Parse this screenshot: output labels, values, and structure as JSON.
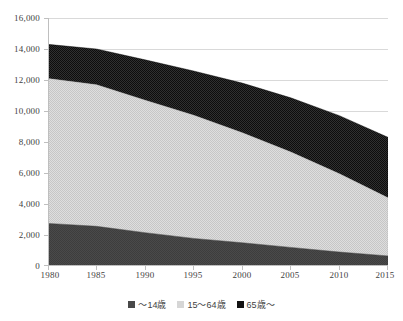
{
  "chart_data": {
    "type": "area",
    "stacked": true,
    "title": "",
    "subtitle": "",
    "xlabel": "",
    "ylabel": "",
    "x": [
      1980,
      1985,
      1990,
      1995,
      2000,
      2005,
      2010,
      2015
    ],
    "categories": [
      "1980",
      "1985",
      "1990",
      "1995",
      "2000",
      "2005",
      "2010",
      "2015"
    ],
    "series": [
      {
        "name": "〜14歳",
        "color": "#494949",
        "pattern": "solid-dark-gray",
        "values": [
          2750,
          2560,
          2150,
          1780,
          1500,
          1200,
          900,
          650
        ]
      },
      {
        "name": "15〜64歳",
        "color": "#d6d6d6",
        "pattern": "light-gray-checker",
        "values": [
          9350,
          9140,
          8550,
          7950,
          7100,
          6150,
          5050,
          3750
        ]
      },
      {
        "name": "65歳〜",
        "color": "#121212",
        "pattern": "black-dotted",
        "values": [
          2200,
          2300,
          2600,
          2850,
          3200,
          3500,
          3750,
          3900
        ]
      }
    ],
    "cumulative_totals": [
      14300,
      14000,
      13300,
      12580,
      11800,
      10850,
      9700,
      8300
    ],
    "ylim": [
      0,
      16000
    ],
    "ytick_step": 2000,
    "yticks": [
      0,
      2000,
      4000,
      6000,
      8000,
      10000,
      12000,
      14000,
      16000
    ],
    "ytick_labels": [
      "0",
      "2,000",
      "4,000",
      "6,000",
      "8,000",
      "10,000",
      "12,000",
      "14,000",
      "16,000"
    ],
    "xticks": [
      1980,
      1985,
      1990,
      1995,
      2000,
      2005,
      2010,
      2015
    ],
    "xtick_labels": [
      "1980",
      "1985",
      "1990",
      "1995",
      "2000",
      "2005",
      "2010",
      "2015"
    ],
    "grid": "horizontal",
    "legend_position": "bottom",
    "legend_entries": [
      "〜14歳",
      "15〜64歳",
      "65歳〜"
    ]
  },
  "axis": {
    "y_labels": [
      "16,000",
      "14,000",
      "12,000",
      "10,000",
      "8,000",
      "6,000",
      "4,000",
      "2,000",
      "0"
    ],
    "x_labels": [
      "1980",
      "1985",
      "1990",
      "1995",
      "2000",
      "2005",
      "2010",
      "2015"
    ]
  },
  "legend": {
    "items": [
      {
        "label": "〜14歳",
        "color": "#494949"
      },
      {
        "label": "15〜64歳",
        "color": "#d6d6d6"
      },
      {
        "label": "65歳〜",
        "color": "#121212"
      }
    ]
  },
  "colors": {
    "series_young": "#494949",
    "series_working": "#d6d6d6",
    "series_elderly": "#121212",
    "gridline": "#d9d9d9",
    "axis": "#bfbfbf",
    "text": "#3f3f3f",
    "background": "#ffffff"
  }
}
